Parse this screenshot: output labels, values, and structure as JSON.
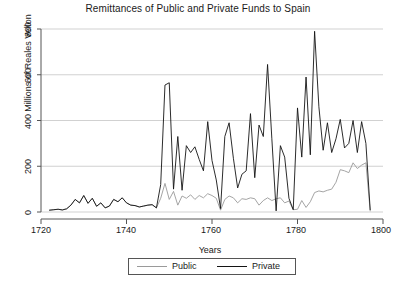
{
  "chart_data": {
    "type": "line",
    "title": "Remittances of Public and Private Funds to Spain",
    "xlabel": "Years",
    "ylabel": "Millions of Reales Vellon",
    "xlim": [
      1720,
      1800
    ],
    "ylim": [
      0,
      800
    ],
    "xticks": [
      1720,
      1740,
      1760,
      1780,
      1800
    ],
    "yticks": [
      0,
      200,
      400,
      600,
      800
    ],
    "grid": "horizontal",
    "legend_position": "below-axis-center",
    "colors": {
      "public": "#9a9a9a",
      "private": "#141414",
      "grid": "#cccccc",
      "axis": "#555555",
      "background": "#ffffff"
    },
    "x": [
      1722,
      1723,
      1724,
      1725,
      1726,
      1727,
      1728,
      1729,
      1730,
      1731,
      1732,
      1733,
      1734,
      1735,
      1736,
      1737,
      1738,
      1739,
      1740,
      1741,
      1742,
      1743,
      1744,
      1745,
      1746,
      1747,
      1748,
      1749,
      1750,
      1751,
      1752,
      1753,
      1754,
      1755,
      1756,
      1757,
      1758,
      1759,
      1760,
      1761,
      1762,
      1763,
      1764,
      1765,
      1766,
      1767,
      1768,
      1769,
      1770,
      1771,
      1772,
      1773,
      1774,
      1775,
      1776,
      1777,
      1778,
      1779,
      1780,
      1781,
      1782,
      1783,
      1784,
      1785,
      1786,
      1787,
      1788,
      1789,
      1790,
      1791,
      1792,
      1793,
      1794,
      1795,
      1796,
      1797
    ],
    "series": [
      {
        "name": "Public",
        "values": [
          8,
          10,
          12,
          9,
          14,
          30,
          55,
          40,
          72,
          38,
          60,
          25,
          40,
          18,
          26,
          55,
          45,
          62,
          40,
          30,
          28,
          22,
          26,
          30,
          32,
          18,
          60,
          125,
          55,
          90,
          30,
          70,
          60,
          75,
          55,
          72,
          62,
          80,
          72,
          60,
          8,
          55,
          70,
          62,
          40,
          58,
          55,
          62,
          58,
          30,
          50,
          62,
          50,
          58,
          62,
          40,
          48,
          10,
          12,
          50,
          20,
          45,
          85,
          92,
          88,
          95,
          100,
          130,
          185,
          180,
          172,
          215,
          190,
          205,
          215,
          5
        ]
      },
      {
        "name": "Private",
        "values": [
          8,
          10,
          12,
          9,
          14,
          30,
          55,
          40,
          72,
          38,
          60,
          25,
          40,
          18,
          26,
          55,
          45,
          62,
          40,
          30,
          28,
          22,
          26,
          30,
          32,
          18,
          120,
          555,
          565,
          100,
          330,
          95,
          290,
          260,
          285,
          230,
          180,
          395,
          225,
          140,
          15,
          330,
          390,
          235,
          105,
          165,
          180,
          430,
          150,
          380,
          330,
          645,
          320,
          5,
          290,
          240,
          60,
          10,
          455,
          240,
          590,
          250,
          790,
          460,
          270,
          390,
          260,
          320,
          405,
          280,
          300,
          400,
          260,
          395,
          300,
          10
        ]
      }
    ]
  },
  "legend": {
    "public_label": "Public",
    "private_label": "Private"
  },
  "axis_labels": {
    "y_ticks": [
      "0",
      "200",
      "400",
      "600",
      "800"
    ],
    "x_ticks": [
      "1720",
      "1740",
      "1760",
      "1780",
      "1800"
    ]
  }
}
